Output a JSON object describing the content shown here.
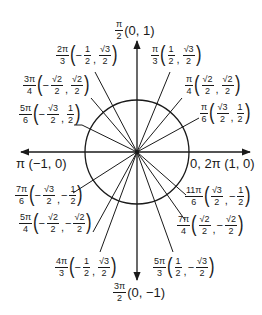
{
  "diagram": {
    "center": [
      137,
      152
    ],
    "radius": 52,
    "stroke_color": "#1a1a1a",
    "axes": {
      "x_from": 21,
      "x_to": 250,
      "y_from": 41,
      "y_to": 280
    },
    "axis_labels": {
      "top": {
        "angle_num": "π",
        "angle_den": "2",
        "coords": "(0, 1)"
      },
      "bottom": {
        "angle_num": "3π",
        "angle_den": "2",
        "coords": "(0, −1)"
      },
      "left": {
        "text": "π (−1, 0)"
      },
      "right": {
        "text": "0, 2π (1, 0)"
      }
    },
    "points": [
      {
        "id": "pi-3",
        "angle_num": "π",
        "angle_den": "3",
        "x": {
          "sign": "",
          "num": "1",
          "den": "2"
        },
        "y": {
          "sign": "",
          "num": "√3",
          "den": "2"
        },
        "line_end": [
          170,
          72
        ]
      },
      {
        "id": "pi-4",
        "angle_num": "π",
        "angle_den": "4",
        "x": {
          "sign": "",
          "num": "√2",
          "den": "2"
        },
        "y": {
          "sign": "",
          "num": "√2",
          "den": "2"
        },
        "line_end": [
          182,
          98
        ]
      },
      {
        "id": "pi-6",
        "angle_num": "π",
        "angle_den": "6",
        "x": {
          "sign": "",
          "num": "√3",
          "den": "2"
        },
        "y": {
          "sign": "",
          "num": "1",
          "den": "2"
        },
        "line_end": [
          199,
          118
        ]
      },
      {
        "id": "2pi-3",
        "angle_num": "2π",
        "angle_den": "3",
        "x": {
          "sign": "−",
          "num": "1",
          "den": "2"
        },
        "y": {
          "sign": "",
          "num": "√3",
          "den": "2"
        },
        "line_end": [
          95,
          72
        ]
      },
      {
        "id": "3pi-4",
        "angle_num": "3π",
        "angle_den": "4",
        "x": {
          "sign": "−",
          "num": "√2",
          "den": "2"
        },
        "y": {
          "sign": "",
          "num": "√2",
          "den": "2"
        },
        "line_end": [
          91,
          98
        ]
      },
      {
        "id": "5pi-6",
        "angle_num": "5π",
        "angle_den": "6",
        "x": {
          "sign": "−",
          "num": "√3",
          "den": "2"
        },
        "y": {
          "sign": "",
          "num": "1",
          "den": "2"
        },
        "line_end": [
          82,
          125
        ]
      },
      {
        "id": "7pi-6",
        "angle_num": "7π",
        "angle_den": "6",
        "x": {
          "sign": "−",
          "num": "√3",
          "den": "2"
        },
        "y": {
          "sign": "−",
          "num": "1",
          "den": "2"
        },
        "line_end": [
          73,
          193
        ]
      },
      {
        "id": "5pi-4",
        "angle_num": "5π",
        "angle_den": "4",
        "x": {
          "sign": "−",
          "num": "√2",
          "den": "2"
        },
        "y": {
          "sign": "−",
          "num": "√2",
          "den": "2"
        },
        "line_end": [
          93,
          232
        ]
      },
      {
        "id": "4pi-3",
        "angle_num": "4π",
        "angle_den": "3",
        "x": {
          "sign": "−",
          "num": "1",
          "den": "2"
        },
        "y": {
          "sign": "",
          "num": "√3",
          "den": "2"
        },
        "line_end": [
          100,
          252
        ]
      },
      {
        "id": "5pi-3",
        "angle_num": "5π",
        "angle_den": "3",
        "x": {
          "sign": "",
          "num": "1",
          "den": "2"
        },
        "y": {
          "sign": "−",
          "num": "√3",
          "den": "2"
        },
        "line_end": [
          173,
          252
        ]
      },
      {
        "id": "7pi-4",
        "angle_num": "7π",
        "angle_den": "4",
        "x": {
          "sign": "",
          "num": "√2",
          "den": "2"
        },
        "y": {
          "sign": "−",
          "num": "√2",
          "den": "2"
        },
        "line_end": [
          185,
          220
        ]
      },
      {
        "id": "11pi-6",
        "angle_num": "11π",
        "angle_den": "6",
        "x": {
          "sign": "",
          "num": "√3",
          "den": "2"
        },
        "y": {
          "sign": "−",
          "num": "1",
          "den": "2"
        },
        "line_end": [
          186,
          195
        ]
      }
    ]
  }
}
